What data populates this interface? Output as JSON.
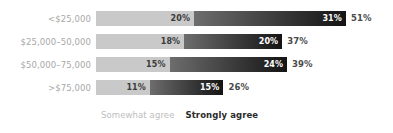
{
  "chart_data": {
    "type": "bar",
    "subtype": "stacked-horizontal",
    "title": "",
    "xlabel": "",
    "ylabel": "",
    "grid": false,
    "legend_position": "bottom-left",
    "xlim": [
      0,
      51
    ],
    "categories": [
      "<$25,000",
      "$25,000–50,000",
      "$50,000–75,000",
      ">$75,000"
    ],
    "series": [
      {
        "name": "Somewhat agree",
        "color": "#c9c9c9",
        "values": [
          20,
          18,
          15,
          11
        ]
      },
      {
        "name": "Strongly agree",
        "color": "#1a1a1a",
        "values": [
          31,
          20,
          24,
          15
        ]
      }
    ],
    "totals": [
      51,
      37,
      39,
      26
    ],
    "rows": [
      {
        "category": "<$25,000",
        "somewhat": "20%",
        "somewhat_value": 20,
        "strongly": "31%",
        "strongly_value": 31,
        "total": "51%",
        "total_value": 51
      },
      {
        "category": "$25,000–50,000",
        "somewhat": "18%",
        "somewhat_value": 18,
        "strongly": "20%",
        "strongly_value": 20,
        "total": "37%",
        "total_value": 37
      },
      {
        "category": "$50,000–75,000",
        "somewhat": "15%",
        "somewhat_value": 15,
        "strongly": "24%",
        "strongly_value": 24,
        "total": "39%",
        "total_value": 39
      },
      {
        "category": ">$75,000",
        "somewhat": "11%",
        "somewhat_value": 11,
        "strongly": "15%",
        "strongly_value": 15,
        "total": "26%",
        "total_value": 26
      }
    ]
  },
  "legend": {
    "somewhat": "Somewhat agree",
    "strongly": "Strongly agree"
  },
  "style": {
    "somewhat_color": "#c9c9c9",
    "strongly_color": "#1a1a1a",
    "label_color": "#a8a8a8",
    "total_color": "#4a4a4a",
    "background": "#ffffff",
    "px_per_percent": 4.9
  }
}
